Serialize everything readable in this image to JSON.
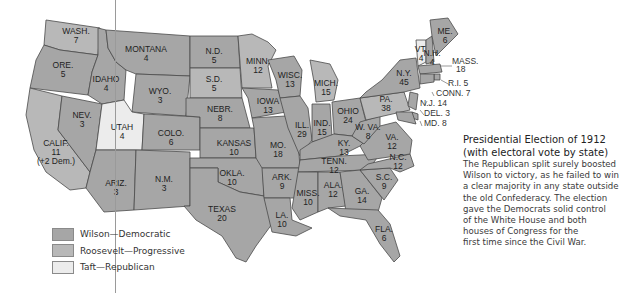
{
  "title": "Presidential Election of 1912",
  "subtitle": "(with electoral vote by state)",
  "body_lines": [
    "The Republican split surely boosted",
    "Wilson to victory, as he failed to win",
    "a clear majority in any state outside",
    "the old Confederacy. The election",
    "gave the Democrats solid control",
    "of the White House and both",
    "houses of Congress for the",
    "first time since the Civil War."
  ],
  "colors": {
    "wilson": "#a6a6a6",
    "roosevelt": "#b8b8b8",
    "taft": "#ececec",
    "border": "#4a4a4a"
  },
  "legend": [
    {
      "party": "wilson",
      "label": "Wilson—Democratic"
    },
    {
      "party": "roosevelt",
      "label": "Roosevelt—Progressive"
    },
    {
      "party": "taft",
      "label": "Taft—Republican"
    }
  ],
  "states": [
    {
      "name": "WASH.",
      "votes": "7",
      "party": "roosevelt"
    },
    {
      "name": "ORE.",
      "votes": "5",
      "party": "wilson"
    },
    {
      "name": "CALIF.",
      "votes": "11",
      "note": "(+2 Dem.)",
      "party": "roosevelt"
    },
    {
      "name": "NEV.",
      "votes": "3",
      "party": "wilson"
    },
    {
      "name": "IDAHO",
      "votes": "4",
      "party": "wilson"
    },
    {
      "name": "MONTANA",
      "votes": "4",
      "party": "wilson"
    },
    {
      "name": "WYO.",
      "votes": "3",
      "party": "wilson"
    },
    {
      "name": "UTAH",
      "votes": "4",
      "party": "taft"
    },
    {
      "name": "COLO.",
      "votes": "6",
      "party": "wilson"
    },
    {
      "name": "ARIZ.",
      "votes": "3",
      "party": "wilson"
    },
    {
      "name": "N.M.",
      "votes": "3",
      "party": "wilson"
    },
    {
      "name": "N.D.",
      "votes": "5",
      "party": "wilson"
    },
    {
      "name": "S.D.",
      "votes": "5",
      "party": "roosevelt"
    },
    {
      "name": "NEBR.",
      "votes": "8",
      "party": "wilson"
    },
    {
      "name": "KANSAS",
      "votes": "10",
      "party": "wilson"
    },
    {
      "name": "OKLA.",
      "votes": "10",
      "party": "wilson"
    },
    {
      "name": "TEXAS",
      "votes": "20",
      "party": "wilson"
    },
    {
      "name": "MINN.",
      "votes": "12",
      "party": "roosevelt"
    },
    {
      "name": "IOWA",
      "votes": "13",
      "party": "wilson"
    },
    {
      "name": "MO.",
      "votes": "18",
      "party": "wilson"
    },
    {
      "name": "ARK.",
      "votes": "9",
      "party": "wilson"
    },
    {
      "name": "LA.",
      "votes": "10",
      "party": "wilson"
    },
    {
      "name": "WISC.",
      "votes": "13",
      "party": "wilson"
    },
    {
      "name": "ILL.",
      "votes": "29",
      "party": "wilson"
    },
    {
      "name": "MICH.",
      "votes": "15",
      "party": "roosevelt"
    },
    {
      "name": "IND.",
      "votes": "15",
      "party": "wilson"
    },
    {
      "name": "OHIO",
      "votes": "24",
      "party": "wilson"
    },
    {
      "name": "KY.",
      "votes": "13",
      "party": "wilson"
    },
    {
      "name": "TENN.",
      "votes": "12",
      "party": "wilson"
    },
    {
      "name": "MISS.",
      "votes": "10",
      "party": "wilson"
    },
    {
      "name": "ALA.",
      "votes": "12",
      "party": "wilson"
    },
    {
      "name": "GA.",
      "votes": "14",
      "party": "wilson"
    },
    {
      "name": "FLA.",
      "votes": "6",
      "party": "wilson"
    },
    {
      "name": "S.C.",
      "votes": "9",
      "party": "wilson"
    },
    {
      "name": "N.C.",
      "votes": "12",
      "party": "wilson"
    },
    {
      "name": "VA.",
      "votes": "12",
      "party": "wilson"
    },
    {
      "name": "W. VA.",
      "votes": "8",
      "party": "wilson"
    },
    {
      "name": "PA.",
      "votes": "38",
      "party": "roosevelt"
    },
    {
      "name": "N.Y.",
      "votes": "45",
      "party": "wilson"
    },
    {
      "name": "VT.",
      "votes": "4",
      "party": "taft"
    },
    {
      "name": "N.H.",
      "votes": "4",
      "party": "wilson"
    },
    {
      "name": "ME.",
      "votes": "6",
      "party": "wilson"
    },
    {
      "name": "MASS.",
      "votes": "18",
      "party": "wilson"
    },
    {
      "name": "R.I.",
      "votes": "5",
      "party": "wilson"
    },
    {
      "name": "CONN.",
      "votes": "7",
      "party": "wilson"
    },
    {
      "name": "N.J.",
      "votes": "14",
      "party": "wilson"
    },
    {
      "name": "DEL.",
      "votes": "3",
      "party": "wilson"
    },
    {
      "name": "MD.",
      "votes": "8",
      "party": "wilson"
    }
  ]
}
